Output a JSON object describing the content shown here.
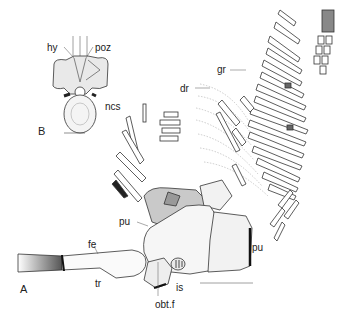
{
  "figure": {
    "panels": [
      {
        "id": "A",
        "label": "A"
      },
      {
        "id": "B",
        "label": "B"
      }
    ],
    "labels": {
      "hy": "hy",
      "poz": "poz",
      "ncs": "ncs",
      "dr": "dr",
      "gr": "gr",
      "pu_left": "pu",
      "pu_right": "pu",
      "fe": "fe",
      "tr": "tr",
      "is": "is",
      "obt_f": "obt.f"
    },
    "colors": {
      "ink": "#222222",
      "shade": "#9a9a9a",
      "light": "#d8d8d8",
      "background": "#ffffff"
    }
  }
}
